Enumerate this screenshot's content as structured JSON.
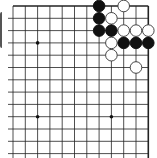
{
  "board": {
    "size": 19,
    "visible_region": "top-right corner",
    "grid": {
      "x_lines": [
        13,
        25.3,
        37.6,
        49.9,
        62.2,
        74.5,
        86.8,
        99.1,
        111.4,
        123.7,
        136,
        148.3
      ],
      "y_lines": [
        6,
        18.3,
        30.6,
        42.9,
        55.2,
        67.5,
        79.8,
        92.1,
        104.4,
        116.7,
        129,
        141.3,
        153.6
      ],
      "edge_right": true,
      "edge_top": true,
      "line_color": "#222222",
      "background": "#ffffff"
    },
    "star_points": [
      {
        "col": 2,
        "row": 3
      },
      {
        "col": 2,
        "row": 9
      },
      {
        "col": 8,
        "row": 9
      }
    ],
    "stones": [
      {
        "color": "black",
        "col": 7,
        "row": 0
      },
      {
        "color": "black",
        "col": 7,
        "row": 1
      },
      {
        "color": "black",
        "col": 7,
        "row": 2
      },
      {
        "color": "black",
        "col": 8,
        "row": 2
      },
      {
        "color": "black",
        "col": 9,
        "row": 3
      },
      {
        "color": "black",
        "col": 10,
        "row": 3
      },
      {
        "color": "black",
        "col": 11,
        "row": 3
      },
      {
        "color": "white",
        "col": 9,
        "row": 0
      },
      {
        "color": "white",
        "col": 8,
        "row": 1
      },
      {
        "color": "white",
        "col": 9,
        "row": 2
      },
      {
        "color": "white",
        "col": 10,
        "row": 2
      },
      {
        "color": "white",
        "col": 11,
        "row": 2
      },
      {
        "color": "white",
        "col": 8,
        "row": 3
      },
      {
        "color": "white",
        "col": 8,
        "row": 4
      },
      {
        "color": "white",
        "col": 10,
        "row": 5
      }
    ],
    "colors": {
      "black_stone": "#111111",
      "white_stone_fill": "#ffffff",
      "white_stone_stroke": "#333333",
      "star_point": "#111111"
    }
  }
}
